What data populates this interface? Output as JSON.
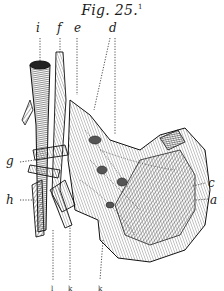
{
  "figure": {
    "title": "Fig. 25.",
    "footnote_marker": "1",
    "labels": {
      "i": "i",
      "f": "f",
      "e": "e",
      "d": "d",
      "g": "g",
      "h": "h",
      "c": "c",
      "a": "a"
    },
    "bottom_labels": [
      "l",
      "k",
      "k"
    ],
    "colors": {
      "ink": "#1a1a1a",
      "paper": "#ffffff"
    }
  }
}
